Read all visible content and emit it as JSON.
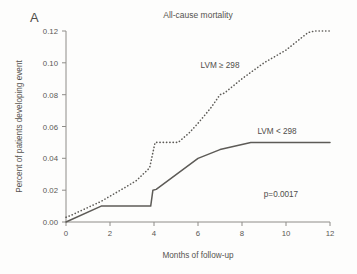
{
  "figure": {
    "panel_label": "A",
    "background_color": "#fdfdfc",
    "ink_color": "#5d5b57"
  },
  "chart_data": {
    "type": "line",
    "title": "All-cause mortality",
    "xlabel": "Months of follow-up",
    "ylabel": "Percent of patients developing event",
    "xlim": [
      0,
      12
    ],
    "ylim": [
      0,
      0.12
    ],
    "xticks": [
      0,
      2,
      4,
      6,
      8,
      10,
      12
    ],
    "xtick_labels": [
      "0",
      "2",
      "4",
      "6",
      "8",
      "10",
      "12"
    ],
    "yticks": [
      0.0,
      0.02,
      0.04,
      0.06,
      0.08,
      0.1,
      0.12
    ],
    "ytick_labels": [
      "0.00",
      "0.02",
      "0.04",
      "0.06",
      "0.08",
      "0.10",
      "0.12"
    ],
    "grid": false,
    "legend_position": "inline-annotations",
    "annotations": [
      {
        "name": "p-value",
        "text": "p=0.0017",
        "x": 9.8,
        "y": 0.016
      },
      {
        "name": "series-label-high",
        "text": "LVM ≥ 298",
        "x": 7.0,
        "y": 0.101
      },
      {
        "name": "series-label-low",
        "text": "LVM < 298",
        "x": 9.6,
        "y": 0.0585
      }
    ],
    "series": [
      {
        "name": "LVM ≥ 298",
        "style": "dotted",
        "label": "LVM ≥ 298",
        "x": [
          0,
          0.2,
          1.6,
          2.6,
          3.2,
          3.8,
          4.05,
          4.15,
          5.1,
          5.6,
          6.0,
          6.6,
          7.0,
          7.2,
          8.0,
          9.0,
          10.0,
          11.0,
          11.3,
          12.0
        ],
        "y": [
          0.003,
          0.004,
          0.013,
          0.021,
          0.026,
          0.034,
          0.05,
          0.05,
          0.05,
          0.056,
          0.062,
          0.072,
          0.08,
          0.081,
          0.09,
          0.1,
          0.108,
          0.119,
          0.12,
          0.12
        ]
      },
      {
        "name": "LVM < 298",
        "style": "solid",
        "label": "LVM < 298",
        "x": [
          0,
          1.6,
          3.85,
          3.95,
          4.1,
          6.0,
          7.0,
          8.4,
          12.0
        ],
        "y": [
          0.0,
          0.01,
          0.01,
          0.02,
          0.0205,
          0.04,
          0.0455,
          0.05,
          0.05
        ]
      }
    ]
  }
}
